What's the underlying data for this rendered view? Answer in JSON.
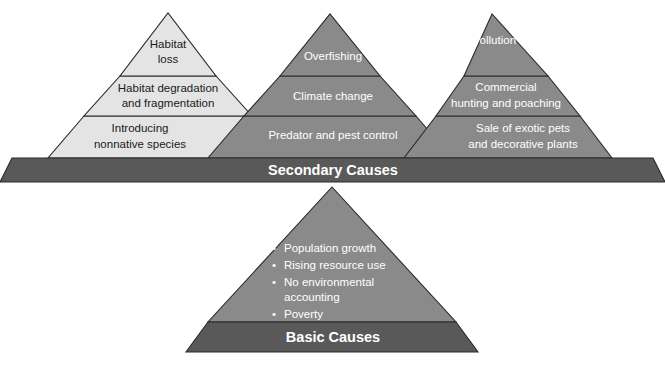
{
  "diagram": {
    "colors": {
      "light_pyramid_fill": "#e4e4e4",
      "medium_pyramid_fill": "#8a8a8a",
      "dark_band_fill": "#595959",
      "outline": "#2b2b2b",
      "background": "#ffffff",
      "dark_text": "#1a1a1a",
      "light_text": "#ffffff"
    },
    "pyramids": [
      {
        "id": "habitat-pyramid",
        "tone": "light",
        "layers": [
          {
            "id": "habitat-loss",
            "lines": [
              "Habitat",
              "loss"
            ]
          },
          {
            "id": "habitat-degradation",
            "lines": [
              "Habitat degradation",
              "and fragmentation"
            ]
          },
          {
            "id": "nonnative-species",
            "lines": [
              "Introducing",
              "nonnative species"
            ]
          }
        ]
      },
      {
        "id": "overexploitation-pyramid",
        "tone": "medium",
        "layers": [
          {
            "id": "overfishing",
            "lines": [
              "Overfishing"
            ]
          },
          {
            "id": "climate-change",
            "lines": [
              "Climate change"
            ]
          },
          {
            "id": "predator-pest-control",
            "lines": [
              "Predator and pest control"
            ]
          }
        ]
      },
      {
        "id": "pollution-pyramid",
        "tone": "medium",
        "layers": [
          {
            "id": "pollution",
            "lines": [
              "Pollution"
            ]
          },
          {
            "id": "commercial-hunting",
            "lines": [
              "Commercial",
              "hunting and poaching"
            ]
          },
          {
            "id": "exotic-pets",
            "lines": [
              "Sale of exotic pets",
              "and decorative plants"
            ]
          }
        ]
      }
    ],
    "secondary_band": {
      "id": "secondary-causes-band",
      "label": "Secondary Causes"
    },
    "basic_pyramid": {
      "id": "basic-causes-pyramid",
      "tone": "medium",
      "bullets": [
        {
          "id": "population-growth",
          "lines": [
            "Population growth"
          ]
        },
        {
          "id": "rising-resource-use",
          "lines": [
            "Rising resource use"
          ]
        },
        {
          "id": "no-environmental-accounting",
          "lines": [
            "No environmental",
            "accounting"
          ]
        },
        {
          "id": "poverty",
          "lines": [
            "Poverty"
          ]
        }
      ],
      "bullet_glyph": "•"
    },
    "basic_band": {
      "id": "basic-causes-band",
      "label": "Basic Causes"
    }
  }
}
